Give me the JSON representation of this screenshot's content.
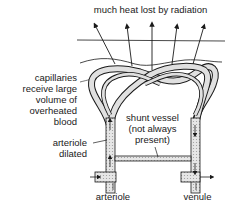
{
  "diagram": {
    "title_label": "much heat lost by radiation",
    "labels": {
      "capillaries": [
        "capillaries",
        "receive large",
        "volume of",
        "overheated",
        "blood"
      ],
      "arteriole_dilated": [
        "arteriole",
        "dilated"
      ],
      "shunt_vessel": [
        "shunt vessel",
        "(not always",
        "present)"
      ],
      "arteriole": "arteriole",
      "venule": "venule"
    },
    "colors": {
      "line": "#1a1a1a",
      "vessel_fill": "#d9d9d9"
    }
  }
}
